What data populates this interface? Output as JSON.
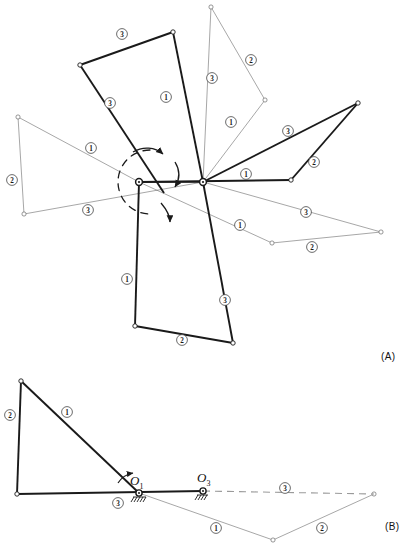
{
  "figure": {
    "type": "kinematic-linkage-diagram",
    "panels": [
      {
        "id": "A",
        "tag": "(A)"
      },
      {
        "id": "B",
        "tag": "(B)"
      }
    ]
  },
  "panelA": {
    "tag": "(A)",
    "pivots": [
      {
        "name": "left-pivot",
        "x": 139,
        "y": 182
      },
      {
        "name": "right-pivot",
        "x": 203,
        "y": 182
      }
    ],
    "arc": {
      "name": "dashed-rotation-arc",
      "cx": 150,
      "cy": 182,
      "r": 32
    },
    "link_labels": [
      {
        "id": "a1",
        "text": "3",
        "x": 122,
        "y": 34
      },
      {
        "id": "a2",
        "text": "1",
        "x": 166,
        "y": 97
      },
      {
        "id": "a3",
        "text": "3",
        "x": 110,
        "y": 103
      },
      {
        "id": "a4",
        "text": "3",
        "x": 212,
        "y": 78
      },
      {
        "id": "a5",
        "text": "2",
        "x": 251,
        "y": 60
      },
      {
        "id": "a6",
        "text": "1",
        "x": 231,
        "y": 122
      },
      {
        "id": "a7",
        "text": "1",
        "x": 91,
        "y": 148
      },
      {
        "id": "a8",
        "text": "2",
        "x": 12,
        "y": 180
      },
      {
        "id": "a9",
        "text": "3",
        "x": 88,
        "y": 210
      },
      {
        "id": "a10",
        "text": "3",
        "x": 288,
        "y": 131
      },
      {
        "id": "a11",
        "text": "2",
        "x": 314,
        "y": 162
      },
      {
        "id": "a12",
        "text": "1",
        "x": 246,
        "y": 174
      },
      {
        "id": "a13",
        "text": "3",
        "x": 306,
        "y": 212
      },
      {
        "id": "a14",
        "text": "2",
        "x": 312,
        "y": 247
      },
      {
        "id": "a15",
        "text": "1",
        "x": 240,
        "y": 225
      },
      {
        "id": "a16",
        "text": "1",
        "x": 127,
        "y": 279
      },
      {
        "id": "a17",
        "text": "3",
        "x": 225,
        "y": 300
      },
      {
        "id": "a18",
        "text": "2",
        "x": 182,
        "y": 340
      }
    ]
  },
  "panelB": {
    "tag": "(B)",
    "pivots": [
      {
        "name": "O1",
        "label": "O",
        "sub": "1",
        "x": 139,
        "y": 493
      },
      {
        "name": "O3",
        "label": "O",
        "sub": "3",
        "x": 203,
        "y": 491
      }
    ],
    "link_labels": [
      {
        "id": "b1",
        "text": "2",
        "x": 10,
        "y": 415
      },
      {
        "id": "b2",
        "text": "1",
        "x": 67,
        "y": 412
      },
      {
        "id": "b3",
        "text": "3",
        "x": 118,
        "y": 503
      },
      {
        "id": "b4",
        "text": "3",
        "x": 285,
        "y": 488
      },
      {
        "id": "b5",
        "text": "1",
        "x": 216,
        "y": 528
      },
      {
        "id": "b6",
        "text": "2",
        "x": 322,
        "y": 528
      }
    ]
  },
  "style": {
    "ink": "#1a1a1a",
    "thin_ink": "#6b6b6b",
    "bold_width": 1.9,
    "thin_width": 0.6
  }
}
